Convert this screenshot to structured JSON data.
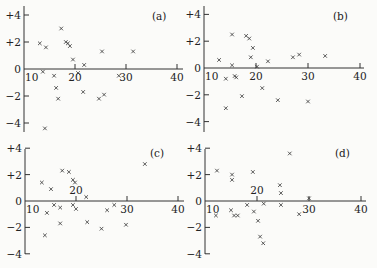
{
  "chart_data": [
    {
      "type": "scatter",
      "panel_label": "(a)",
      "xlabel": "",
      "ylabel": "",
      "xlim": [
        10,
        41
      ],
      "ylim": [
        -4.5,
        4.5
      ],
      "xticks": [
        10,
        20,
        30,
        40
      ],
      "xtick_labels": [
        "10",
        "20",
        "30",
        "40"
      ],
      "yticks": [
        4,
        2,
        0,
        -2,
        -4
      ],
      "ytick_labels": [
        "+4",
        "+2",
        "0",
        "−2",
        "−4"
      ],
      "grid": false,
      "marker": "x",
      "points": [
        [
          13.1,
          1.9
        ],
        [
          14.3,
          1.6
        ],
        [
          17.3,
          3.0
        ],
        [
          18.2,
          2.0
        ],
        [
          18.6,
          1.9
        ],
        [
          19.0,
          1.7
        ],
        [
          19.6,
          0.7
        ],
        [
          21.8,
          0.3
        ],
        [
          25.3,
          1.3
        ],
        [
          31.4,
          1.3
        ],
        [
          13.7,
          -0.2
        ],
        [
          15.9,
          -0.5
        ],
        [
          20.6,
          -0.3
        ],
        [
          16.3,
          -1.4
        ],
        [
          16.7,
          -2.2
        ],
        [
          21.6,
          -1.7
        ],
        [
          24.7,
          -2.2
        ],
        [
          25.7,
          -1.9
        ],
        [
          14.1,
          -4.4
        ],
        [
          28.6,
          -0.5
        ]
      ]
    },
    {
      "type": "scatter",
      "panel_label": "(b)",
      "xlabel": "",
      "ylabel": "",
      "xlim": [
        10,
        41
      ],
      "ylim": [
        -4.5,
        4.5
      ],
      "xticks": [
        10,
        20,
        30,
        40
      ],
      "xtick_labels": [
        "10",
        "20",
        "30",
        "40"
      ],
      "yticks": [
        4,
        2,
        0,
        -2,
        -4
      ],
      "ytick_labels": [
        "+4",
        "+2",
        "0",
        "−2",
        "−4"
      ],
      "grid": false,
      "marker": "x",
      "points": [
        [
          12.9,
          0.6
        ],
        [
          15.4,
          2.5
        ],
        [
          18.1,
          2.4
        ],
        [
          18.7,
          2.2
        ],
        [
          19.4,
          1.5
        ],
        [
          19.0,
          0.8
        ],
        [
          15.4,
          0.2
        ],
        [
          20.2,
          0.1
        ],
        [
          22.3,
          0.5
        ],
        [
          14.2,
          -0.8
        ],
        [
          15.9,
          -0.6
        ],
        [
          16.2,
          -0.7
        ],
        [
          21.2,
          -1.5
        ],
        [
          17.3,
          -2.1
        ],
        [
          14.2,
          -3.0
        ],
        [
          24.2,
          -2.4
        ],
        [
          27.1,
          0.8
        ],
        [
          28.3,
          1.0
        ],
        [
          33.3,
          0.9
        ],
        [
          30.0,
          -2.5
        ]
      ]
    },
    {
      "type": "scatter",
      "panel_label": "(c)",
      "xlabel": "",
      "ylabel": "",
      "xlim": [
        10,
        41
      ],
      "ylim": [
        -4.5,
        4.5
      ],
      "xticks": [
        10,
        20,
        30,
        40
      ],
      "xtick_labels": [
        "10",
        "20",
        "30",
        "40"
      ],
      "yticks": [
        4,
        2,
        0,
        -2,
        -4
      ],
      "ytick_labels": [
        "+4",
        "+2",
        "0",
        "−2",
        "−4"
      ],
      "grid": false,
      "marker": "x",
      "points": [
        [
          13.3,
          1.4
        ],
        [
          15.1,
          0.9
        ],
        [
          17.3,
          2.3
        ],
        [
          18.6,
          2.2
        ],
        [
          19.4,
          1.6
        ],
        [
          19.8,
          1.4
        ],
        [
          22.0,
          0.3
        ],
        [
          14.3,
          -0.9
        ],
        [
          15.7,
          -0.3
        ],
        [
          16.9,
          -0.5
        ],
        [
          19.4,
          -0.3
        ],
        [
          20.0,
          -0.6
        ],
        [
          16.9,
          -1.7
        ],
        [
          13.9,
          -2.6
        ],
        [
          22.2,
          -1.6
        ],
        [
          25.0,
          -2.1
        ],
        [
          33.5,
          2.8
        ],
        [
          26.1,
          -0.7
        ],
        [
          27.5,
          -0.3
        ],
        [
          29.8,
          -1.8
        ]
      ]
    },
    {
      "type": "scatter",
      "panel_label": "(d)",
      "xlabel": "",
      "ylabel": "",
      "xlim": [
        10,
        41
      ],
      "ylim": [
        -4.5,
        4.5
      ],
      "xticks": [
        10,
        20,
        30,
        40
      ],
      "xtick_labels": [
        "10",
        "20",
        "30",
        "40"
      ],
      "yticks": [
        4,
        2,
        0,
        -2,
        -4
      ],
      "ytick_labels": [
        "+4",
        "+2",
        "0",
        "−2",
        "−4"
      ],
      "grid": false,
      "marker": "x",
      "points": [
        [
          12.3,
          2.3
        ],
        [
          15.2,
          2.0
        ],
        [
          15.2,
          1.6
        ],
        [
          19.2,
          2.2
        ],
        [
          24.4,
          1.2
        ],
        [
          24.6,
          0.6
        ],
        [
          12.1,
          -1.1
        ],
        [
          15.0,
          -0.7
        ],
        [
          15.6,
          -1.1
        ],
        [
          16.3,
          -1.1
        ],
        [
          18.1,
          -0.3
        ],
        [
          19.4,
          -0.8
        ],
        [
          21.3,
          -0.2
        ],
        [
          20.2,
          -1.5
        ],
        [
          24.6,
          -0.3
        ],
        [
          26.3,
          3.6
        ],
        [
          20.6,
          -2.7
        ],
        [
          21.2,
          -3.2
        ],
        [
          28.1,
          -1.0
        ],
        [
          30.0,
          0.2
        ]
      ]
    }
  ],
  "layout": {
    "panels": [
      {
        "origin_px": [
          24,
          69
        ],
        "x_unit_px": 5.1,
        "y_unit_px": 13.5,
        "y_top_px": 6,
        "y_bottom_px": 132,
        "x_end_px": 183,
        "label_pos": [
          152,
          20
        ],
        "x20_label_above": false
      },
      {
        "origin_px": [
          204,
          68
        ],
        "x_unit_px": 5.2,
        "y_unit_px": 13.4,
        "y_top_px": 6,
        "y_bottom_px": 132,
        "x_end_px": 364,
        "label_pos": [
          333,
          20
        ],
        "x20_label_above": false
      },
      {
        "origin_px": [
          25,
          201
        ],
        "x_unit_px": 5.1,
        "y_unit_px": 13.2,
        "y_top_px": 149,
        "y_bottom_px": 254,
        "x_end_px": 184,
        "label_pos": [
          150,
          157
        ],
        "x20_label_above": true
      },
      {
        "origin_px": [
          205,
          201
        ],
        "x_unit_px": 5.2,
        "y_unit_px": 13.2,
        "y_top_px": 149,
        "y_bottom_px": 254,
        "x_end_px": 366,
        "label_pos": [
          335,
          157
        ],
        "x20_label_above": true
      }
    ]
  }
}
